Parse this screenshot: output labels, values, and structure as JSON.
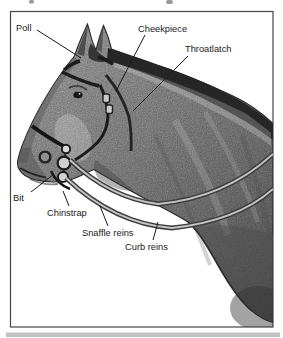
{
  "figure": {
    "type": "labeled-illustration",
    "labels": [
      {
        "id": "poll",
        "text": "Poll"
      },
      {
        "id": "cheekpiece",
        "text": "Cheekpiece"
      },
      {
        "id": "throatlatch",
        "text": "Throatlatch"
      },
      {
        "id": "bit",
        "text": "Bit"
      },
      {
        "id": "chinstrap",
        "text": "Chinstrap"
      },
      {
        "id": "snaffle-reins",
        "text": "Snaffle reins"
      },
      {
        "id": "curb-reins",
        "text": "Curb reins"
      }
    ],
    "colors": {
      "frame": "#454545",
      "label_text": "#1a1a1a",
      "background": "#ffffff",
      "bottom_strip": "#c2c2c2",
      "mane": "#262626",
      "body_mid": "#9a9a9a"
    }
  }
}
